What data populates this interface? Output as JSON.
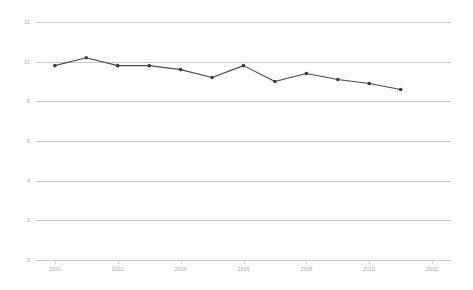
{
  "chart_data": {
    "type": "line",
    "title": "",
    "subtitle": "",
    "xlabel": "",
    "ylabel": "",
    "x": [
      2000,
      2001,
      2002,
      2003,
      2004,
      2005,
      2006,
      2007,
      2008,
      2009,
      2010,
      2011
    ],
    "values": [
      9.8,
      10.2,
      9.8,
      9.8,
      9.6,
      9.2,
      9.8,
      9.0,
      9.4,
      9.1,
      8.9,
      8.6
    ],
    "series": [
      {
        "name": "",
        "values": [
          9.8,
          10.2,
          9.8,
          9.8,
          9.6,
          9.2,
          9.8,
          9.0,
          9.4,
          9.1,
          8.9,
          8.6
        ]
      }
    ],
    "ylim": [
      0,
      12
    ],
    "xlim": [
      1999.4,
      2012.6
    ],
    "y_ticks": [
      0,
      2,
      4,
      6,
      8,
      10,
      12
    ],
    "y_tick_labels": [
      "0",
      "2",
      "4",
      "6",
      "8",
      "10",
      "12"
    ],
    "x_ticks": [
      2000,
      2002,
      2004,
      2006,
      2008,
      2010,
      2012
    ],
    "x_tick_labels": [
      "2000",
      "2002",
      "2004",
      "2006",
      "2008",
      "2010",
      "2012"
    ],
    "grid": true,
    "legend": false,
    "legend_position": "none",
    "line_color": "#4a4a4a",
    "marker_color": "#3c3c3c",
    "grid_color": "#c8c8c8",
    "tick_label_color": "#a8a8a8",
    "background_color": "#ffffff",
    "annotations": []
  }
}
